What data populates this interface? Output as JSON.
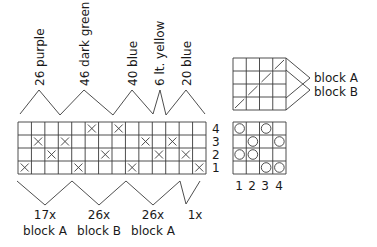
{
  "colors": {
    "line": "#3a3a3a",
    "text": "#1a1a1a",
    "background": "#ffffff"
  },
  "color_sections": [
    {
      "label": "26 purple"
    },
    {
      "label": "46 dark green"
    },
    {
      "label": "40 blue"
    },
    {
      "label": "6 lt. yellow"
    },
    {
      "label": "20 blue"
    }
  ],
  "main_chart": {
    "columns": 14,
    "rows": 4,
    "row_labels": [
      "4",
      "3",
      "2",
      "1"
    ],
    "marks_symbol": "x",
    "marks": {
      "row4": [
        6,
        8
      ],
      "row3": [
        2,
        4,
        10,
        12
      ],
      "row2": [
        3,
        7,
        11,
        13
      ],
      "row1": [
        1,
        5,
        9,
        14
      ]
    }
  },
  "repeats": [
    {
      "count": "17x",
      "block": "block A"
    },
    {
      "count": "26x",
      "block": "block B"
    },
    {
      "count": "26x",
      "block": "block A"
    },
    {
      "count": "1x",
      "block": ""
    }
  ],
  "block_key": {
    "labels": [
      "block A",
      "block B"
    ],
    "diagonal_cells": [
      [
        1,
        4
      ],
      [
        2,
        3
      ],
      [
        3,
        2
      ],
      [
        4,
        1
      ]
    ]
  },
  "symbol_key": {
    "column_labels": [
      "1",
      "2",
      "3",
      "4"
    ],
    "marks_symbol": "circle",
    "marks": {
      "row4": [
        1,
        3
      ],
      "row3": [
        2,
        4
      ],
      "row2": [
        1,
        2
      ],
      "row1": [
        3,
        4
      ]
    }
  }
}
